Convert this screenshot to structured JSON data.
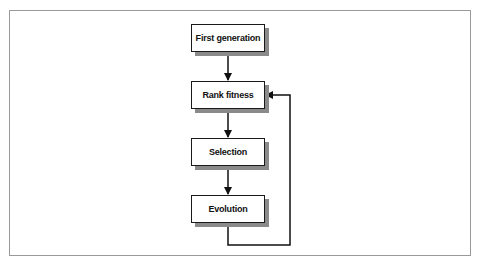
{
  "diagram": {
    "type": "flowchart",
    "nodes": [
      {
        "id": "first_generation",
        "label": "First generation"
      },
      {
        "id": "rank_fitness",
        "label": "Rank fitness"
      },
      {
        "id": "selection",
        "label": "Selection"
      },
      {
        "id": "evolution",
        "label": "Evolution"
      }
    ],
    "edges": [
      {
        "from": "first_generation",
        "to": "rank_fitness"
      },
      {
        "from": "rank_fitness",
        "to": "selection"
      },
      {
        "from": "selection",
        "to": "evolution"
      },
      {
        "from": "evolution",
        "to": "rank_fitness",
        "kind": "feedback-loop"
      }
    ]
  }
}
